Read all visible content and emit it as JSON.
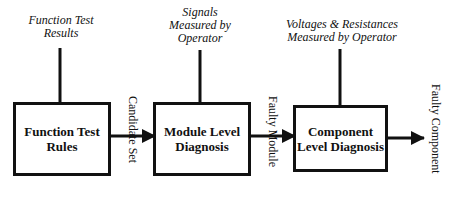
{
  "diagram": {
    "type": "block-flow",
    "inputs": [
      {
        "id": "function-test-results",
        "lines": [
          "Function Test",
          "Results"
        ]
      },
      {
        "id": "signals-measured",
        "lines": [
          "Signals",
          "Measured by",
          "Operator"
        ]
      },
      {
        "id": "voltages-resistances",
        "lines": [
          "Voltages & Resistances",
          "Measured by Operator"
        ]
      }
    ],
    "blocks": [
      {
        "id": "function-test-rules",
        "lines": [
          "Function Test",
          "Rules"
        ]
      },
      {
        "id": "module-level-diagnosis",
        "lines": [
          "Module Level",
          "Diagnosis"
        ]
      },
      {
        "id": "component-level-diagnosis",
        "lines": [
          "Component",
          "Level Diagnosis"
        ]
      }
    ],
    "edge_labels": [
      {
        "id": "candidate-set",
        "text": "Candidate Set"
      },
      {
        "id": "faulty-module",
        "text": "Faulty Module"
      },
      {
        "id": "faulty-component",
        "text": "Faulty Component"
      }
    ],
    "colors": {
      "stroke": "#111111",
      "background": "#ffffff"
    }
  }
}
